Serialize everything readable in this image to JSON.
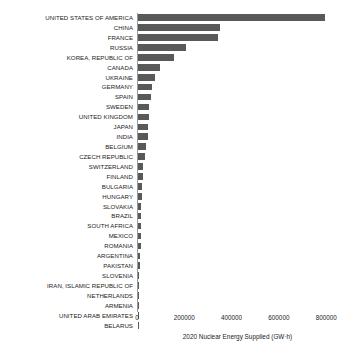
{
  "chart_data": {
    "type": "bar",
    "orientation": "horizontal",
    "title": "",
    "xlabel": "2020 Nuclear Energy Supplied (GW·h)",
    "ylabel": "",
    "xlim": [
      0,
      850000
    ],
    "xticks": [
      0,
      200000,
      400000,
      600000,
      800000
    ],
    "xtick_labels": [
      "0",
      "200000",
      "400000",
      "600000",
      "800000"
    ],
    "grid": false,
    "legend": "none",
    "bar_color": "#595959",
    "categories": [
      "UNITED STATES OF AMERICA",
      "CHINA",
      "FRANCE",
      "RUSSIA",
      "KOREA, REPUBLIC OF",
      "CANADA",
      "UKRAINE",
      "GERMANY",
      "SPAIN",
      "SWEDEN",
      "UNITED KINGDOM",
      "JAPAN",
      "INDIA",
      "BELGIUM",
      "CZECH REPUBLIC",
      "SWITZERLAND",
      "FINLAND",
      "BULGARIA",
      "HUNGARY",
      "SLOVAKIA",
      "BRAZIL",
      "SOUTH AFRICA",
      "MEXICO",
      "ROMANIA",
      "ARGENTINA",
      "PAKISTAN",
      "SLOVENIA",
      "IRAN, ISLAMIC REPUBLIC OF",
      "NETHERLANDS",
      "ARMENIA",
      "UNITED ARAB EMIRATES",
      "BELARUS"
    ],
    "values": [
      789919,
      344748,
      338671,
      201821,
      152583,
      92166,
      71548,
      60918,
      55800,
      47362,
      45668,
      43040,
      40374,
      32793,
      28416,
      23004,
      22350,
      15893,
      15180,
      14460,
      13200,
      11600,
      10865,
      10600,
      10005,
      9900,
      6000,
      5800,
      3900,
      2500,
      1600,
      900
    ]
  }
}
